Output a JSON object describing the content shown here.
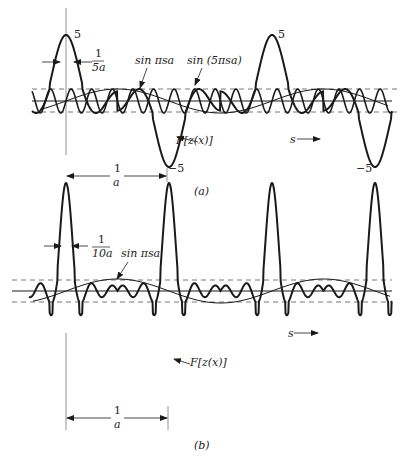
{
  "figure": {
    "colors": {
      "ink": "#1a1a1a",
      "guide": "#555555",
      "background": "#ffffff"
    },
    "panels": [
      {
        "id": "a",
        "caption": "(a)",
        "axis_y": 101,
        "dash_upper_y": 89,
        "dash_lower_y": 112,
        "x_start": 32,
        "x_end": 392,
        "period_px": 103,
        "origin_x": 66,
        "peak_amp_px": 66,
        "ripple_amp_px": 12,
        "sin_amp_px": 12,
        "fast_freq": 5,
        "peak_width_px": 11,
        "vertical_line": {
          "x": 66,
          "y1": 8,
          "y2": 155
        },
        "labels": {
          "peak_value": "5",
          "peak_value_2": "5",
          "width_num": "1",
          "width_den": "5a",
          "sin_slow": "sin πsa",
          "sin_fast": "sin (5πsa)",
          "func": "F[z(x)]",
          "trough_value": "−5",
          "trough_value_2": "−5",
          "s_axis": "s",
          "period_num": "1",
          "period_den": "a"
        }
      },
      {
        "id": "b",
        "caption": "(b)",
        "axis_y": 291,
        "dash_upper_y": 280,
        "dash_lower_y": 302,
        "x_start": 29,
        "x_end": 392,
        "period_px": 103,
        "origin_x": 66,
        "peak_amp_px": 108,
        "ripple_amp_px": 11,
        "sin_amp_px": 12,
        "fast_freq": 10,
        "peak_width_px": 6,
        "vertical_line": {
          "x": 66,
          "y1": 333,
          "y2": 430
        },
        "labels": {
          "width_num": "1",
          "width_den": "10a",
          "sin_slow": "sin πsa",
          "func": "F[z(x)]",
          "s_axis": "s",
          "period_num": "1",
          "period_den": "a"
        }
      }
    ]
  }
}
